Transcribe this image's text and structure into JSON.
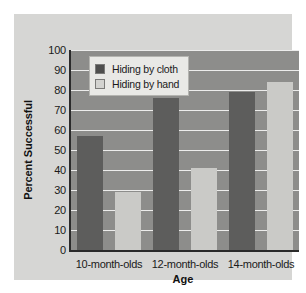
{
  "chart_data": {
    "type": "bar",
    "title": "",
    "xlabel": "Age",
    "ylabel": "Percent Successful",
    "categories": [
      "10-month-olds",
      "12-month-olds",
      "14-month-olds"
    ],
    "series": [
      {
        "name": "Hiding by cloth",
        "values": [
          57,
          76,
          79
        ],
        "color": "#5d5d5c"
      },
      {
        "name": "Hiding by hand",
        "values": [
          29,
          41,
          84
        ],
        "color": "#cacac7"
      }
    ],
    "ylim": [
      0,
      100
    ],
    "ytick_step": 10,
    "yticks": [
      0,
      10,
      20,
      30,
      40,
      50,
      60,
      70,
      80,
      90,
      100
    ],
    "ytick_labels": [
      "0",
      "10",
      "20",
      "30",
      "40",
      "50",
      "60",
      "70",
      "80",
      "90",
      "100"
    ],
    "grid": true,
    "grid_axis": "y",
    "grid_color": "#ececeb",
    "legend_position": "top-left",
    "plot_background": "#8d8d8b",
    "figure_background": "#d6d6d4",
    "axis_color": "#2b2b2b"
  }
}
